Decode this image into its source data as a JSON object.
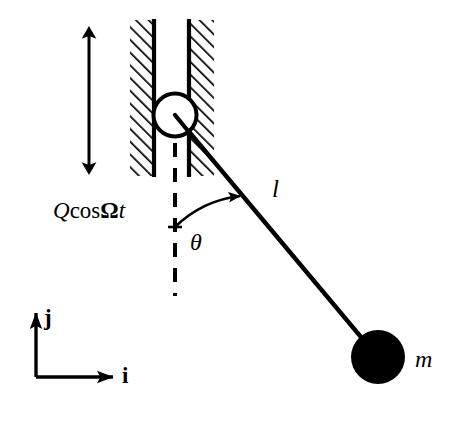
{
  "figure": {
    "background_color": "#ffffff",
    "stroke_color": "#000000"
  },
  "labels": {
    "forcing": {
      "full_text": "QcosΩt",
      "amplitude_symbol": "Q",
      "function_name": "cos",
      "frequency_symbol": "Ω",
      "time_symbol": "t"
    },
    "angle": "θ",
    "rod_length": "l",
    "mass": "m",
    "unit_vector_x": "i",
    "unit_vector_y": "j"
  },
  "geometry": {
    "pivot": {
      "x": 175,
      "y": 115,
      "radius": 22
    },
    "bob": {
      "x": 378,
      "y": 357,
      "radius": 27
    },
    "rod": {
      "x1": 175,
      "y1": 115,
      "x2": 371,
      "y2": 349
    },
    "vertical_dashed": {
      "x": 175,
      "y1": 118,
      "y2": 296
    },
    "left_wall": {
      "x1": 130,
      "x2": 155,
      "y1": 20,
      "y2": 176
    },
    "right_wall": {
      "x1": 188,
      "x2": 214,
      "y1": 20,
      "y2": 176
    },
    "oscillation_arrow": {
      "x": 89,
      "y1": 28,
      "y2": 173
    },
    "angle_arc": {
      "cx": 175,
      "cy": 115,
      "radius": 112
    },
    "axes_origin": {
      "x": 36,
      "y": 377
    },
    "axis_i_end": {
      "x": 113,
      "y": 377
    },
    "axis_j_end": {
      "x": 36,
      "y": 313
    }
  },
  "icons": {
    "pivot": "open-circle-pivot-icon",
    "bob": "filled-circle-mass-icon",
    "hatching": "diagonal-hatch-icon",
    "double_arrow": "double-headed-vertical-arrow-icon",
    "angle_arc": "curved-arrow-icon"
  }
}
